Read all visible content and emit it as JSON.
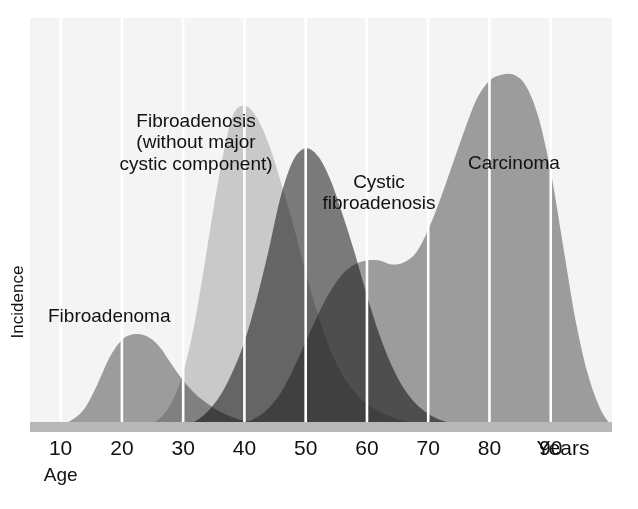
{
  "chart_data": {
    "type": "area",
    "title": "",
    "subtitle": "",
    "xlabel": "Age",
    "xunit": "Years",
    "ylabel": "Incidence",
    "grid": true,
    "grid_orientation": "vertical",
    "legend_position": "inline-annotations",
    "xlim": [
      5,
      100
    ],
    "ylim": [
      0,
      100
    ],
    "xticks": [
      10,
      20,
      30,
      40,
      50,
      60,
      70,
      80,
      90
    ],
    "xtick_labels": [
      "10",
      "20",
      "30",
      "40",
      "50",
      "60",
      "70",
      "80",
      "90"
    ],
    "yticks": [],
    "ytick_labels": [],
    "x": [
      5,
      8,
      10,
      12,
      14,
      16,
      18,
      20,
      22,
      24,
      26,
      28,
      30,
      32,
      34,
      36,
      38,
      40,
      42,
      44,
      46,
      48,
      50,
      52,
      54,
      56,
      58,
      60,
      62,
      64,
      66,
      68,
      70,
      72,
      74,
      76,
      78,
      80,
      82,
      84,
      86,
      88,
      90,
      92,
      94,
      96,
      98,
      100
    ],
    "series": [
      {
        "name": "Fibroadenoma",
        "label": "Fibroadenoma",
        "color": "#9b9b9b",
        "peak_age": 21,
        "peak_value": 24,
        "values": [
          0,
          0,
          0.5,
          2,
          5,
          11,
          18,
          22.5,
          24,
          23.5,
          21,
          16.5,
          12,
          8.5,
          6,
          4,
          2.6,
          1.6,
          1,
          0.6,
          0.3,
          0.1,
          0,
          0,
          0,
          0,
          0,
          0,
          0,
          0,
          0,
          0,
          0,
          0,
          0,
          0,
          0,
          0,
          0,
          0,
          0,
          0,
          0,
          0,
          0,
          0,
          0,
          0
        ]
      },
      {
        "name": "Fibroadenosis (without major cystic component)",
        "label": "Fibroadenosis\n(without major\ncystic component)",
        "color": "#c9c9c9",
        "peak_age": 38,
        "peak_value": 83,
        "values": [
          0,
          0,
          0,
          0,
          0,
          0,
          0,
          0,
          0,
          0.5,
          2,
          6,
          14,
          28,
          47,
          66,
          80,
          83,
          80,
          73,
          63,
          52,
          40,
          29,
          20,
          13.5,
          9,
          6,
          4,
          2.6,
          1.6,
          1,
          0.6,
          0.3,
          0.1,
          0,
          0,
          0,
          0,
          0,
          0,
          0,
          0,
          0,
          0,
          0,
          0,
          0
        ]
      },
      {
        "name": "Cystic fibroadenosis",
        "label": "Cystic\nfibroadenosis",
        "color": "#6e6e6e",
        "peak_age": 50,
        "peak_value": 72,
        "values": [
          0,
          0,
          0,
          0,
          0,
          0,
          0,
          0,
          0,
          0,
          0,
          0,
          0.4,
          1.5,
          4,
          8,
          14,
          22,
          33,
          46,
          60,
          69,
          72,
          70,
          64,
          55,
          45,
          34,
          24,
          16,
          10,
          6,
          3.4,
          1.8,
          0.9,
          0.4,
          0.1,
          0,
          0,
          0,
          0,
          0,
          0,
          0,
          0,
          0,
          0,
          0
        ]
      },
      {
        "name": "Carcinoma",
        "label": "Carcinoma",
        "color": "#9b9b9b",
        "peak_age": 83,
        "peak_value": 91,
        "shoulder_age": 63,
        "shoulder_value": 43,
        "values": [
          0,
          0,
          0,
          0,
          0,
          0,
          0,
          0,
          0,
          0,
          0,
          0,
          0,
          0,
          0,
          0,
          0.3,
          1,
          2.5,
          5,
          9,
          15,
          22,
          29,
          35,
          39.5,
          42,
          43,
          43,
          42,
          42.5,
          45,
          51,
          59,
          68,
          77,
          85,
          89.5,
          91,
          91,
          88,
          80,
          66,
          47,
          28,
          14,
          5,
          0
        ]
      }
    ],
    "annotations": [
      {
        "name": "fibroadenoma-label",
        "text": "Fibroadenoma",
        "x_age": 15,
        "y_value": 30
      },
      {
        "name": "fibroadenosis-label",
        "text": "Fibroadenosis (without major cystic component)",
        "x_age": 28,
        "y_value": 78
      },
      {
        "name": "cystic-fibroadenosis-label",
        "text": "Cystic fibroadenosis",
        "x_age": 57,
        "y_value": 64
      },
      {
        "name": "carcinoma-label",
        "text": "Carcinoma",
        "x_age": 83,
        "y_value": 68
      }
    ],
    "colors": {
      "plot_background": "#f4f4f4",
      "page_background": "#ffffff",
      "gridline": "#ffffff",
      "baseline_band": "#b8b8b8",
      "text": "#111111",
      "fibroadenoma": "#9b9b9b",
      "fibroadenosis": "#c9c9c9",
      "cystic_fibroadenosis": "#6e6e6e",
      "carcinoma": "#9b9b9b",
      "overlap_dark": "#757575"
    }
  },
  "axes": {
    "y_label": "Incidence",
    "x_title": "Age",
    "x_unit": "Years",
    "x_tick_labels": [
      "10",
      "20",
      "30",
      "40",
      "50",
      "60",
      "70",
      "80",
      "90"
    ]
  },
  "annotations": {
    "fibroadenoma": "Fibroadenoma",
    "fibroadenosis_line1": "Fibroadenosis",
    "fibroadenosis_line2": "(without major",
    "fibroadenosis_line3": "cystic component)",
    "cystic_line1": "Cystic",
    "cystic_line2": "fibroadenosis",
    "carcinoma": "Carcinoma"
  }
}
